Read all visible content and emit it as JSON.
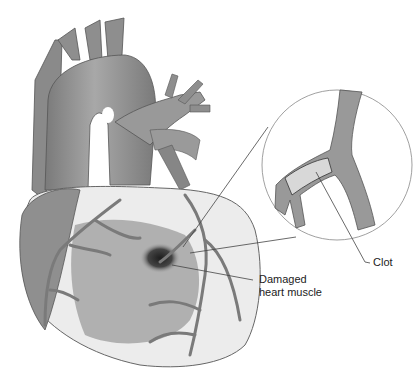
{
  "figure": {
    "labels": {
      "clot": "Clot",
      "damaged_line1": "Damaged",
      "damaged_line2": "heart muscle"
    },
    "colors": {
      "background": "#ffffff",
      "vessel": "#8c8c8c",
      "vessel_dark": "#6e6e6e",
      "muscle": "#a9a9a9",
      "fat": "#f2f2f2",
      "damage": "#2b2b2b",
      "leader_line": "#444444"
    }
  }
}
